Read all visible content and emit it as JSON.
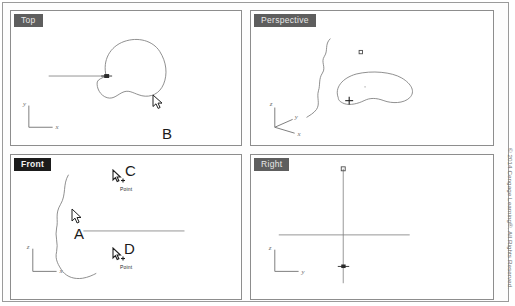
{
  "app": {
    "title": "CAD Four-Viewport Layout"
  },
  "viewports": {
    "top": {
      "label": "Top",
      "axes": {
        "vertical": "y",
        "horizontal": "x"
      },
      "content": "closed freeform kidney curve with center point and horizontal construction line"
    },
    "perspective": {
      "label": "Perspective",
      "axes": {
        "up": "z",
        "depth": "y",
        "horizontal": "x"
      },
      "content": "closed freeform curve in perspective with open wavy curve and point markers"
    },
    "front": {
      "label": "Front",
      "axes": {
        "vertical": "z",
        "horizontal": "x"
      },
      "content": "open wavy vertical curve with horizontal construction line"
    },
    "right": {
      "label": "Right",
      "axes": {
        "vertical": "z",
        "horizontal": "y"
      },
      "content": "vertical line with square endpoint and point marker, crossed by horizontal line"
    }
  },
  "annotations": [
    {
      "id": "A",
      "letter": "A",
      "sublabel": "",
      "viewport": "front"
    },
    {
      "id": "B",
      "letter": "B",
      "sublabel": "",
      "viewport": "top"
    },
    {
      "id": "C",
      "letter": "C",
      "sublabel": "Point",
      "viewport": "front"
    },
    {
      "id": "D",
      "letter": "D",
      "sublabel": "Point",
      "viewport": "front"
    }
  ],
  "footer": {
    "copyright": "© 2014 Cengage Learning®. All Rights Reserved."
  },
  "colors": {
    "geometry": "#6d6d6d",
    "label_dark": "#1b1b1b",
    "label_gray": "#6f6f6f",
    "border": "#8d8d8d",
    "text": "#1a1a1a"
  }
}
